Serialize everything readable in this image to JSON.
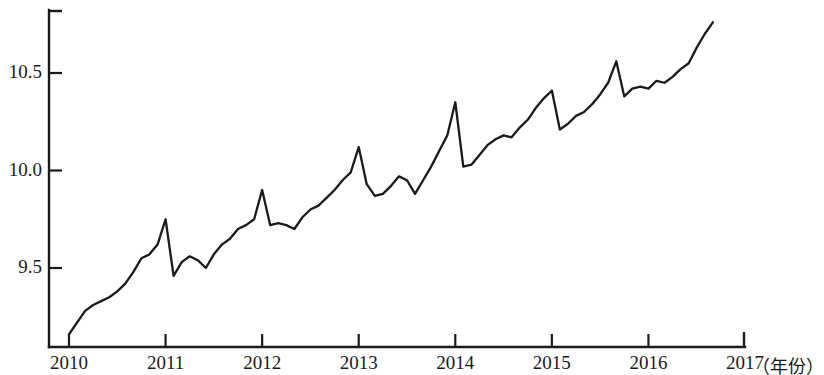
{
  "chart_data": {
    "type": "line",
    "title": "",
    "subtitle": "",
    "xlabel": "年份",
    "ylabel": "",
    "xlim": [
      2010.0,
      2017.0
    ],
    "ylim": [
      9.14,
      10.81
    ],
    "grid": false,
    "legend": null,
    "x_tick_labels": [
      "2010",
      "2011",
      "2012",
      "2013",
      "2014",
      "2015",
      "2016",
      "2017"
    ],
    "x_tick_values": [
      2010,
      2011,
      2012,
      2013,
      2014,
      2015,
      2016,
      2017
    ],
    "y_tick_labels": [
      "9.5",
      "10.0",
      "10.5"
    ],
    "y_tick_values": [
      9.5,
      10.0,
      10.5
    ],
    "series": [
      {
        "name": "series-1",
        "color": "#1a1a1a",
        "x": [
          2010.0,
          2010.083,
          2010.167,
          2010.25,
          2010.333,
          2010.417,
          2010.5,
          2010.583,
          2010.667,
          2010.75,
          2010.833,
          2010.917,
          2011.0,
          2011.083,
          2011.167,
          2011.25,
          2011.333,
          2011.417,
          2011.5,
          2011.583,
          2011.667,
          2011.75,
          2011.833,
          2011.917,
          2012.0,
          2012.083,
          2012.167,
          2012.25,
          2012.333,
          2012.417,
          2012.5,
          2012.583,
          2012.667,
          2012.75,
          2012.833,
          2012.917,
          2013.0,
          2013.083,
          2013.167,
          2013.25,
          2013.333,
          2013.417,
          2013.5,
          2013.583,
          2013.667,
          2013.75,
          2013.833,
          2013.917,
          2014.0,
          2014.083,
          2014.167,
          2014.25,
          2014.333,
          2014.417,
          2014.5,
          2014.583,
          2014.667,
          2014.75,
          2014.833,
          2014.917,
          2015.0,
          2015.083,
          2015.167,
          2015.25,
          2015.333,
          2015.417,
          2015.5,
          2015.583,
          2015.667,
          2015.75,
          2015.833,
          2015.917,
          2016.0,
          2016.083,
          2016.167,
          2016.25,
          2016.333,
          2016.417,
          2016.5,
          2016.583,
          2016.667
        ],
        "y": [
          9.16,
          9.22,
          9.28,
          9.31,
          9.33,
          9.35,
          9.38,
          9.42,
          9.48,
          9.55,
          9.57,
          9.62,
          9.75,
          9.46,
          9.53,
          9.56,
          9.54,
          9.5,
          9.57,
          9.62,
          9.65,
          9.7,
          9.72,
          9.75,
          9.9,
          9.72,
          9.73,
          9.72,
          9.7,
          9.76,
          9.8,
          9.82,
          9.86,
          9.9,
          9.95,
          9.99,
          10.12,
          9.93,
          9.87,
          9.88,
          9.92,
          9.97,
          9.95,
          9.88,
          9.95,
          10.02,
          10.1,
          10.18,
          10.35,
          10.02,
          10.03,
          10.08,
          10.13,
          10.16,
          10.18,
          10.17,
          10.22,
          10.26,
          10.32,
          10.37,
          10.41,
          10.21,
          10.24,
          10.28,
          10.3,
          10.34,
          10.39,
          10.45,
          10.56,
          10.38,
          10.42,
          10.43,
          10.42,
          10.46,
          10.45,
          10.48,
          10.52,
          10.55,
          10.63,
          10.7,
          10.76
        ]
      }
    ]
  },
  "axes": {
    "x_axis_name": "year-axis",
    "y_axis_name": "value-axis",
    "unit_note": "（年份）"
  }
}
